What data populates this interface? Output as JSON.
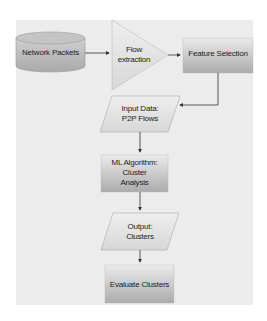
{
  "diagram": {
    "type": "flowchart",
    "nodes": [
      {
        "id": "network_packets",
        "shape": "cylinder",
        "label": "Network Packets"
      },
      {
        "id": "flow_extraction",
        "shape": "triangle",
        "label": "Flow extraction"
      },
      {
        "id": "feature_selection",
        "shape": "rectangle",
        "label": "Feature Selection"
      },
      {
        "id": "input_data",
        "shape": "parallelogram",
        "label": "Input Data: P2P Flows"
      },
      {
        "id": "ml_algorithm",
        "shape": "rectangle",
        "label": "ML Algorithm: Cluster Analysis"
      },
      {
        "id": "output",
        "shape": "parallelogram",
        "label": "Output: Clusters"
      },
      {
        "id": "evaluate",
        "shape": "rectangle",
        "label": "Evaluate Clusters"
      }
    ],
    "edges": [
      {
        "from": "network_packets",
        "to": "flow_extraction"
      },
      {
        "from": "flow_extraction",
        "to": "feature_selection"
      },
      {
        "from": "feature_selection",
        "to": "input_data"
      },
      {
        "from": "input_data",
        "to": "ml_algorithm"
      },
      {
        "from": "ml_algorithm",
        "to": "output"
      },
      {
        "from": "output",
        "to": "evaluate"
      }
    ],
    "labels": {
      "network_packets": "Network Packets",
      "flow_line1": "Flow",
      "flow_line2": "extraction",
      "feature_selection": "Feature Selection",
      "input_line1": "Input Data:",
      "input_line2": "P2P Flows",
      "ml_line1": "ML Algorithm: Cluster",
      "ml_line2": "Analysis",
      "output_line1": "Output:",
      "output_line2": "Clusters",
      "evaluate": "Evaluate Clusters"
    },
    "colors": {
      "panel": "#ececec",
      "shape_top": "#e6e6e6",
      "shape_bottom": "#b0b0b0",
      "arrow": "#333333"
    }
  }
}
